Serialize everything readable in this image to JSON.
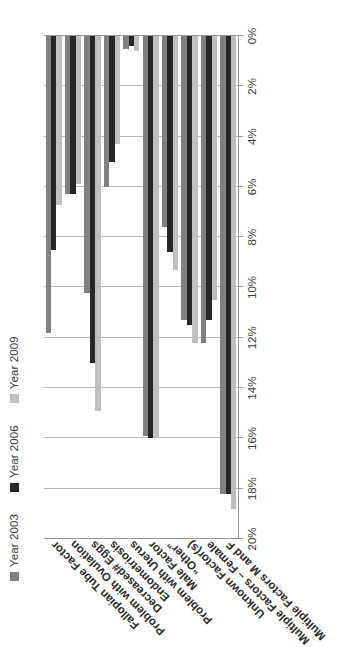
{
  "legend": {
    "position": "top-left",
    "entries": [
      {
        "label": "Year 2003",
        "color": "#808080"
      },
      {
        "label": "Year 2006",
        "color": "#262626"
      },
      {
        "label": "Year 2009",
        "color": "#bfbfbf"
      }
    ]
  },
  "axis": {
    "tick_labels": [
      "20%",
      "18%",
      "16%",
      "14%",
      "12%",
      "10%",
      "8%",
      "6%",
      "4%",
      "2%",
      "0%"
    ]
  },
  "chart_data": {
    "type": "bar",
    "orientation": "horizontal",
    "title": "",
    "subtitle": "",
    "xlabel": "",
    "ylabel": "",
    "xlim": [
      0,
      20
    ],
    "grid": true,
    "legend_position": "top-left",
    "axis_direction": "reversed (20% at left, 0% at right)",
    "value_unit": "%",
    "categories": [
      "Fallopian Tube Factor",
      "Problem with Ovulation",
      "Decreased# Eggs",
      "Endometriosis",
      "Problem with Uterus",
      "Male Factor",
      "“Other”",
      "Unknown Factor(s)",
      "Multiple Factors – Female",
      "Multiple Factors M and F"
    ],
    "series": [
      {
        "name": "Year 2003",
        "color": "#808080",
        "values": [
          11.8,
          6.3,
          10.2,
          6.0,
          0.5,
          15.9,
          7.6,
          11.3,
          12.2,
          18.2
        ]
      },
      {
        "name": "Year 2006",
        "color": "#262626",
        "values": [
          8.5,
          6.3,
          13.0,
          5.0,
          0.4,
          16.0,
          8.6,
          11.5,
          11.3,
          18.2
        ]
      },
      {
        "name": "Year 2009",
        "color": "#bfbfbf",
        "values": [
          6.7,
          5.9,
          14.9,
          4.3,
          0.6,
          16.0,
          9.3,
          12.2,
          10.5,
          18.8
        ]
      }
    ]
  }
}
